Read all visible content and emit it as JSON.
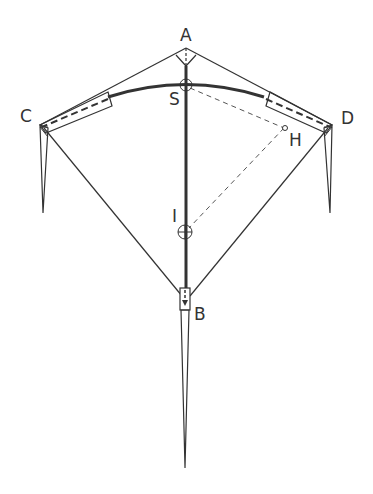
{
  "diagram": {
    "labels": {
      "A": "A",
      "S": "S",
      "C": "C",
      "D": "D",
      "H": "H",
      "I": "I",
      "B": "B"
    },
    "points": {
      "A": [
        186,
        48
      ],
      "S": [
        186,
        85
      ],
      "C": [
        40,
        125
      ],
      "D": [
        332,
        125
      ],
      "H": [
        284,
        128
      ],
      "I": [
        185,
        232
      ],
      "B": [
        185,
        300
      ],
      "tail_tip": [
        185,
        468
      ]
    },
    "colors": {
      "line": "#333333",
      "background": "#ffffff"
    }
  }
}
